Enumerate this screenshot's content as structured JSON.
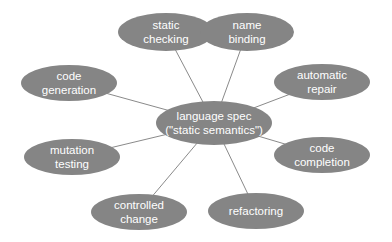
{
  "diagram": {
    "type": "hub-and-spoke",
    "colors": {
      "node_fill": "#858585",
      "node_text": "#ffffff",
      "edge": "#8a8a8a",
      "background": "#ffffff"
    },
    "center": {
      "id": "center",
      "line1": "language spec",
      "line2": "(\"static semantics\")",
      "cx": 214,
      "cy": 123,
      "rx": 58,
      "ry": 22
    },
    "nodes": [
      {
        "id": "static-checking",
        "line1": "static",
        "line2": "checking",
        "cx": 166,
        "cy": 32,
        "rx": 48,
        "ry": 19
      },
      {
        "id": "name-binding",
        "line1": "name",
        "line2": "binding",
        "cx": 247,
        "cy": 32,
        "rx": 47,
        "ry": 19
      },
      {
        "id": "code-generation",
        "line1": "code",
        "line2": "generation",
        "cx": 69,
        "cy": 83,
        "rx": 48,
        "ry": 18
      },
      {
        "id": "automatic-repair",
        "line1": "automatic",
        "line2": "repair",
        "cx": 322,
        "cy": 82,
        "rx": 48,
        "ry": 18
      },
      {
        "id": "mutation-testing",
        "line1": "mutation",
        "line2": "testing",
        "cx": 72,
        "cy": 157,
        "rx": 48,
        "ry": 18
      },
      {
        "id": "code-completion",
        "line1": "code",
        "line2": "completion",
        "cx": 322,
        "cy": 155,
        "rx": 48,
        "ry": 18
      },
      {
        "id": "controlled-change",
        "line1": "controlled",
        "line2": "change",
        "cx": 139,
        "cy": 212,
        "rx": 48,
        "ry": 18
      },
      {
        "id": "refactoring",
        "line1": "refactoring",
        "line2": "",
        "cx": 256,
        "cy": 211,
        "rx": 48,
        "ry": 18
      }
    ],
    "edges": [
      {
        "from": "center",
        "to": "static-checking"
      },
      {
        "from": "center",
        "to": "name-binding"
      },
      {
        "from": "center",
        "to": "code-generation"
      },
      {
        "from": "center",
        "to": "automatic-repair"
      },
      {
        "from": "center",
        "to": "mutation-testing"
      },
      {
        "from": "center",
        "to": "code-completion"
      },
      {
        "from": "center",
        "to": "controlled-change"
      },
      {
        "from": "center",
        "to": "refactoring"
      }
    ]
  }
}
